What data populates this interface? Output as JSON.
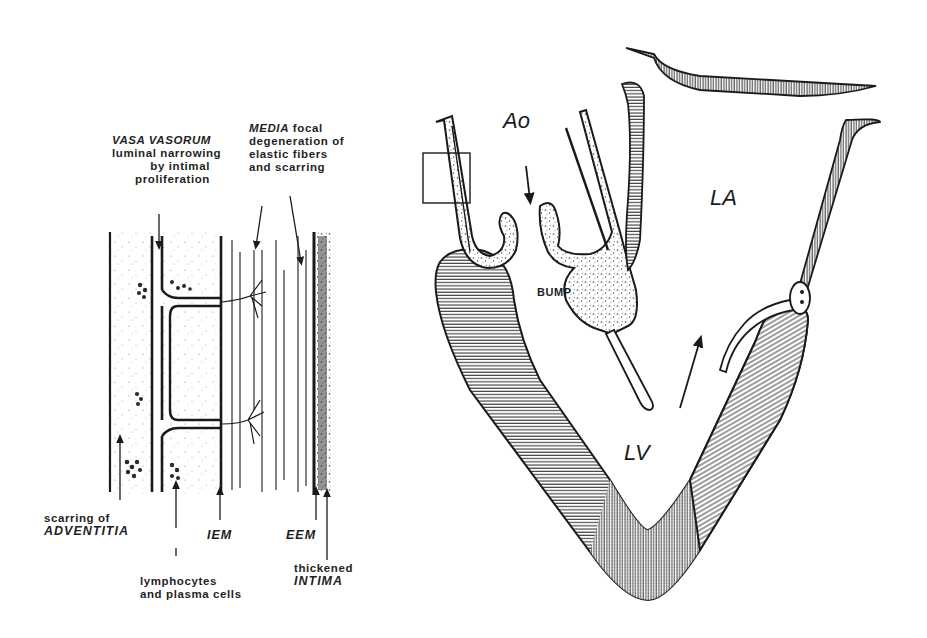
{
  "figure": {
    "left_panel": {
      "title": "Aortic wall histopathology",
      "labels": {
        "vasa_vasorum": {
          "term": "VASA VASORUM",
          "desc_1": "luminal narrowing",
          "desc_2": "by intimal",
          "desc_3": "proliferation"
        },
        "media": {
          "term": "MEDIA",
          "desc_0": "focal",
          "desc_1": "degeneration of",
          "desc_2": "elastic fibers",
          "desc_3": "and scarring"
        },
        "adventitia": {
          "desc": "scarring of",
          "term": "ADVENTITIA"
        },
        "iem": "IEM",
        "eem": "EEM",
        "lymphocytes": {
          "line1": "lymphocytes",
          "line2": "and plasma cells"
        },
        "intima": {
          "desc": "thickened",
          "term": "INTIMA"
        }
      }
    },
    "right_panel": {
      "title": "Left heart long-axis schematic",
      "labels": {
        "aorta": "Ao",
        "left_atrium": "LA",
        "left_ventricle": "LV",
        "bump": "BUMP"
      }
    },
    "colors": {
      "ink": "#1a1a1a",
      "background": "#ffffff",
      "stipple": "#555555"
    }
  }
}
